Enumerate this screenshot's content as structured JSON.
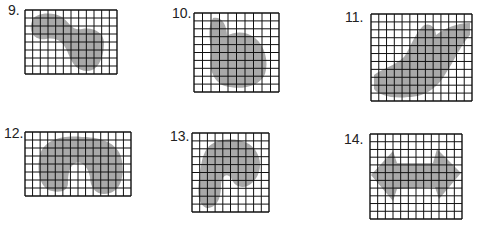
{
  "problems": [
    {
      "number": "9.",
      "cols": 12,
      "rows": 8,
      "description": "irregular shaded region"
    },
    {
      "number": "10.",
      "cols": 10,
      "rows": 10,
      "description": "irregular shaded region"
    },
    {
      "number": "11.",
      "cols": 13,
      "rows": 11,
      "description": "irregular shaded region"
    },
    {
      "number": "12.",
      "cols": 14,
      "rows": 8,
      "description": "arch-shaped shaded region"
    },
    {
      "number": "13.",
      "cols": 10,
      "rows": 10,
      "description": "hook-shaped shaded region"
    },
    {
      "number": "14.",
      "cols": 12,
      "rows": 11,
      "description": "double-arrow shaded region"
    }
  ],
  "colors": {
    "shade": "#a9a9a9",
    "grid": "#111111"
  }
}
